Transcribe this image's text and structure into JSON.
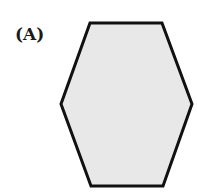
{
  "option": {
    "label": "(A)"
  },
  "shape": {
    "type": "hexagon",
    "orientation": "vertical-elongated, flat top and bottom",
    "points": "90,23 162,23 192,104 163,186 91,186 61,104",
    "fill": "#e8e8e8",
    "stroke": "#111111",
    "stroke_width": 3
  }
}
